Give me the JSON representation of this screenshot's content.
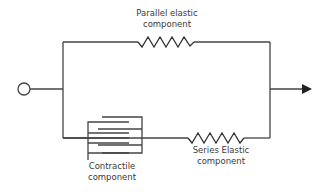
{
  "diagram": {
    "colors": {
      "line": "#444444",
      "text": "#3a3a3a",
      "background": "#ffffff"
    },
    "nodes": {
      "input": {
        "shape": "circle",
        "icon": "open-circle-terminal"
      },
      "output": {
        "shape": "arrow",
        "icon": "arrowhead-right"
      }
    },
    "labels": {
      "parallel_elastic": {
        "line1": "Parallel elastic",
        "line2": "component"
      },
      "contractile": {
        "line1": "Contractile",
        "line2": "component"
      },
      "series_elastic": {
        "line1": "Series Elastic",
        "line2": "component"
      }
    },
    "components": [
      {
        "name": "Parallel elastic component",
        "symbol": "spring",
        "branch": "top"
      },
      {
        "name": "Contractile component",
        "symbol": "interdigitating-filaments",
        "branch": "bottom"
      },
      {
        "name": "Series Elastic component",
        "symbol": "spring",
        "branch": "bottom"
      }
    ]
  }
}
